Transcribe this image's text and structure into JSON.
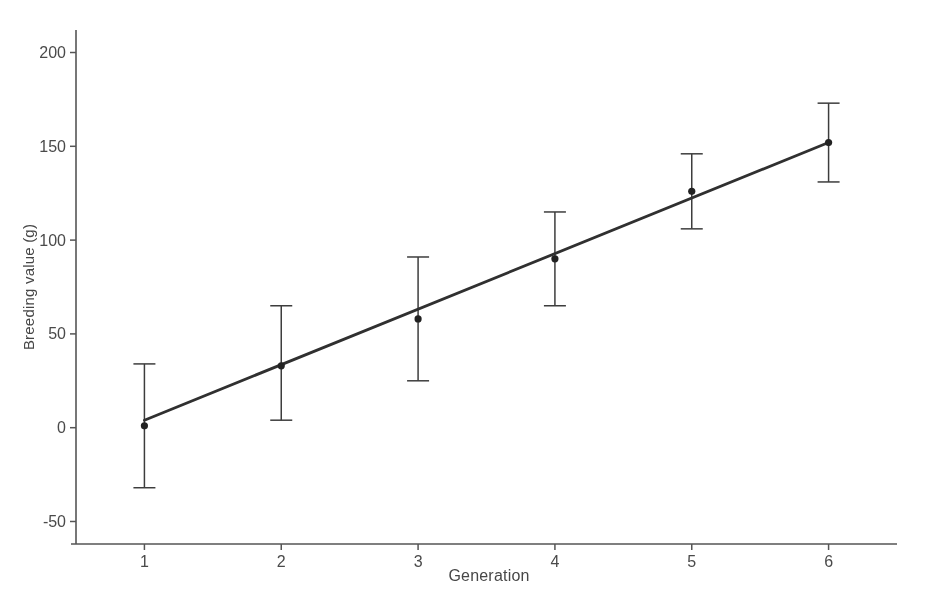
{
  "page": {
    "background": "#ffffff"
  },
  "chart_data": {
    "type": "scatter",
    "title": "",
    "xlabel": "Generation",
    "ylabel": "Breeding value (g)",
    "x": [
      1,
      2,
      3,
      4,
      5,
      6
    ],
    "series": [
      {
        "name": "mean-breeding-value",
        "values": [
          1,
          33,
          58,
          90,
          126,
          152
        ],
        "ci_low": [
          -32,
          4,
          25,
          65,
          106,
          131
        ],
        "ci_high": [
          34,
          65,
          91,
          115,
          146,
          173
        ]
      }
    ],
    "trend_line": {
      "x1": 1,
      "y1": 4,
      "x2": 6,
      "y2": 152
    },
    "xticks": [
      "1",
      "2",
      "3",
      "4",
      "5",
      "6"
    ],
    "yticks": [
      "-50",
      "0",
      "50",
      "100",
      "150",
      "200"
    ],
    "xlim": [
      0.5,
      6.5
    ],
    "ylim": [
      -62,
      212
    ],
    "grid": false,
    "legend": "none",
    "marker": "filled-circle",
    "error_bars": true,
    "colors": {
      "line": "#3d3d3d",
      "trend": "#303030",
      "point": "#222222",
      "axis": "#555555",
      "text": "#4a4a4a"
    }
  }
}
